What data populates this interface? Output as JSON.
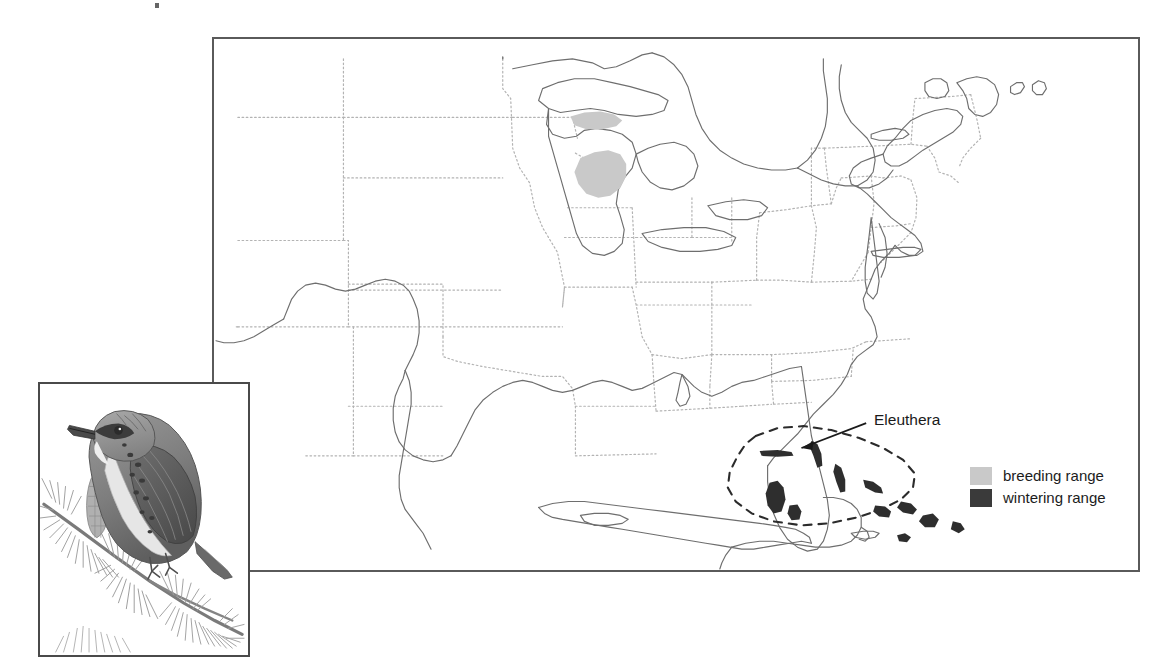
{
  "figure": {
    "type": "range-map",
    "species_illustration": "kirtlands-warbler-on-pine-branch",
    "annotations": [
      {
        "name": "eleuthera",
        "label": "Eleuthera",
        "x": 872,
        "y": 411,
        "arrow_from": [
          868,
          424
        ],
        "arrow_to": [
          800,
          449
        ]
      }
    ]
  },
  "legend": {
    "position": "bottom-right",
    "items": [
      {
        "key": "breeding",
        "label": "breeding range",
        "color": "#c9c9c9"
      },
      {
        "key": "wintering",
        "label": "wintering range",
        "color": "#3a3a3a"
      }
    ]
  },
  "map": {
    "frame": {
      "x": 212,
      "y": 37,
      "width": 928,
      "height": 535,
      "border_color": "#5a5a5a",
      "background": "#ffffff"
    },
    "coastline_color": "#6e6e6e",
    "state_border_color": "#b0b0b0",
    "state_border_style": "dotted",
    "region": "eastern-north-america-and-caribbean",
    "breeding_patches": [
      {
        "name": "upper-michigan",
        "color": "#c9c9c9"
      },
      {
        "name": "northern-lower-michigan",
        "color": "#c9c9c9"
      }
    ],
    "wintering_area": {
      "name": "bahamas-archipelago",
      "outline_style": "dashed",
      "outline_color": "#2b2b2b",
      "island_color": "#2e2e2e",
      "island_count": 11
    }
  },
  "inset": {
    "frame": {
      "x": 38,
      "y": 382,
      "width": 212,
      "height": 275,
      "border_color": "#4a4a4a"
    },
    "content": "pencil illustration of a streaked warbler perched on a pine bough"
  },
  "colors": {
    "page_background": "#ffffff",
    "ink": "#1a1a1a",
    "breeding": "#c9c9c9",
    "wintering": "#3a3a3a"
  }
}
